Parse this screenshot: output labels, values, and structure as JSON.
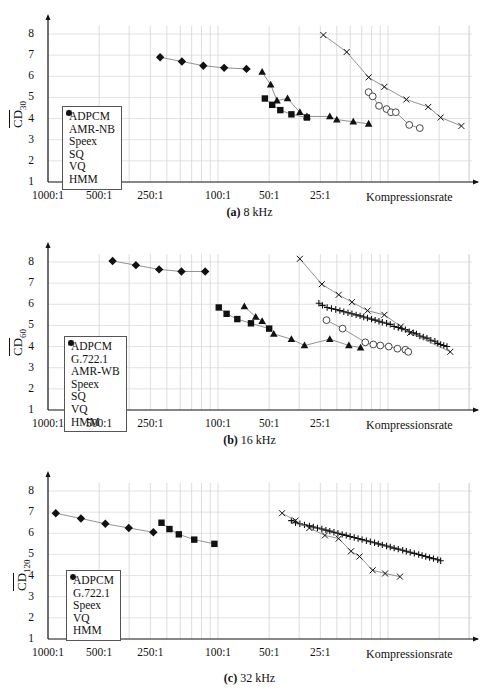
{
  "figure": {
    "x_axis_label": "Kompressionsrate",
    "x_ticks": [
      "1000:1",
      "500:1",
      "250:1",
      "100:1",
      "50:1",
      "25:1"
    ],
    "y_ticks": [
      "1",
      "2",
      "3",
      "4",
      "5",
      "6",
      "7",
      "8"
    ]
  },
  "panels": [
    {
      "caption_tag": "(a)",
      "caption_text": "8 kHz",
      "ylabel_main": "CD",
      "ylabel_sub": "30",
      "legend": [
        "ADPCM",
        "AMR-NB",
        "Speex",
        "SQ",
        "VQ",
        "HMM"
      ]
    },
    {
      "caption_tag": "(b)",
      "caption_text": "16 kHz",
      "ylabel_main": "CD",
      "ylabel_sub": "60",
      "legend": [
        "ADPCM",
        "G.722.1",
        "AMR-WB",
        "Speex",
        "SQ",
        "VQ",
        "HMM"
      ]
    },
    {
      "caption_tag": "(c)",
      "caption_text": "32 kHz",
      "ylabel_main": "CD",
      "ylabel_sub": "120",
      "legend": [
        "ADPCM",
        "G.722.1",
        "Speex",
        "VQ",
        "HMM"
      ]
    }
  ],
  "chart_data": [
    {
      "type": "line",
      "title": "(a) 8 kHz",
      "xlabel": "Kompressionsrate",
      "ylabel": "CD_30 (mean cepstral distance)",
      "xscale": "log (compression ratio, decreasing to the right)",
      "xlim": [
        "1000:1",
        "~2.5:1"
      ],
      "ylim": [
        1,
        8.5
      ],
      "grid": true,
      "legend_position": "lower left",
      "series": [
        {
          "name": "ADPCM",
          "marker": "dot",
          "points": [
            [
              1.9,
              5.55
            ]
          ]
        },
        {
          "name": "AMR-NB",
          "marker": "circle",
          "points": [
            [
              13.0,
              5.25
            ],
            [
              12.3,
              5.05
            ],
            [
              11.3,
              4.6
            ],
            [
              10.2,
              4.45
            ],
            [
              9.6,
              4.3
            ],
            [
              9.0,
              4.3
            ],
            [
              7.5,
              3.7
            ],
            [
              6.5,
              3.55
            ]
          ]
        },
        {
          "name": "Speex",
          "marker": "x",
          "points": [
            [
              24.0,
              7.95
            ],
            [
              17.5,
              7.15
            ],
            [
              13.0,
              5.95
            ],
            [
              10.5,
              5.5
            ],
            [
              7.8,
              4.9
            ],
            [
              5.8,
              4.55
            ],
            [
              4.9,
              4.05
            ],
            [
              3.7,
              3.65
            ]
          ]
        },
        {
          "name": "SQ",
          "marker": "triangle",
          "points": [
            [
              55,
              6.2
            ],
            [
              49,
              5.6
            ],
            [
              45,
              4.85
            ],
            [
              39,
              4.95
            ],
            [
              33,
              4.3
            ],
            [
              30,
              4.1
            ],
            [
              22,
              4.1
            ],
            [
              20,
              3.95
            ],
            [
              16,
              3.85
            ],
            [
              13,
              3.75
            ]
          ]
        },
        {
          "name": "VQ",
          "marker": "square",
          "points": [
            [
              53,
              4.95
            ],
            [
              48,
              4.65
            ],
            [
              43,
              4.4
            ],
            [
              37,
              4.2
            ],
            [
              30,
              4.05
            ]
          ]
        },
        {
          "name": "HMM",
          "marker": "diamond",
          "points": [
            [
              219,
              6.9
            ],
            [
              163,
              6.7
            ],
            [
              122,
              6.5
            ],
            [
              92,
              6.4
            ],
            [
              68,
              6.35
            ]
          ]
        }
      ]
    },
    {
      "type": "line",
      "title": "(b) 16 kHz",
      "xlabel": "Kompressionsrate",
      "ylabel": "CD_60 (mean cepstral distance)",
      "xscale": "log (compression ratio, decreasing to the right)",
      "xlim": [
        "1000:1",
        "~2.5:1"
      ],
      "ylim": [
        1,
        8.5
      ],
      "grid": true,
      "legend_position": "lower left",
      "series": [
        {
          "name": "ADPCM",
          "marker": "dot",
          "points": [
            [
              1.9,
              7.55
            ]
          ]
        },
        {
          "name": "G.722.1",
          "marker": "plus",
          "points": [
            [
              25.5,
              6.05
            ],
            [
              24.3,
              5.95
            ],
            [
              22.8,
              5.85
            ],
            [
              21.5,
              5.8
            ],
            [
              20.3,
              5.75
            ],
            [
              19.2,
              5.7
            ],
            [
              18.2,
              5.65
            ],
            [
              17.2,
              5.6
            ],
            [
              16.3,
              5.55
            ],
            [
              15.4,
              5.5
            ],
            [
              14.6,
              5.45
            ],
            [
              13.9,
              5.4
            ],
            [
              13.2,
              5.35
            ],
            [
              12.5,
              5.3
            ],
            [
              11.9,
              5.25
            ],
            [
              11.3,
              5.2
            ],
            [
              10.8,
              5.15
            ],
            [
              10.2,
              5.1
            ],
            [
              9.7,
              5.05
            ],
            [
              9.2,
              4.95
            ],
            [
              8.7,
              4.9
            ],
            [
              8.3,
              4.85
            ],
            [
              7.9,
              4.8
            ],
            [
              7.5,
              4.7
            ],
            [
              7.1,
              4.65
            ],
            [
              6.8,
              4.6
            ],
            [
              6.5,
              4.5
            ],
            [
              6.2,
              4.45
            ],
            [
              5.9,
              4.4
            ],
            [
              5.6,
              4.3
            ],
            [
              5.3,
              4.25
            ],
            [
              5.1,
              4.15
            ],
            [
              4.9,
              4.1
            ],
            [
              4.7,
              4.05
            ],
            [
              4.5,
              4.0
            ]
          ]
        },
        {
          "name": "AMR-WB",
          "marker": "circle",
          "points": [
            [
              23.0,
              5.25
            ],
            [
              18.5,
              4.85
            ],
            [
              13.6,
              4.2
            ],
            [
              12.2,
              4.1
            ],
            [
              11.1,
              4.05
            ],
            [
              9.9,
              4.0
            ],
            [
              8.8,
              3.9
            ],
            [
              7.9,
              3.85
            ],
            [
              7.6,
              3.75
            ]
          ]
        },
        {
          "name": "Speex",
          "marker": "x",
          "points": [
            [
              33,
              8.15
            ],
            [
              24.5,
              6.95
            ],
            [
              19.5,
              6.45
            ],
            [
              16.3,
              6.1
            ],
            [
              13.2,
              5.7
            ],
            [
              10.5,
              5.5
            ],
            [
              8.4,
              4.95
            ],
            [
              7.4,
              4.65
            ],
            [
              4.3,
              3.75
            ]
          ]
        },
        {
          "name": "SQ",
          "marker": "triangle",
          "points": [
            [
              70,
              5.9
            ],
            [
              60,
              5.4
            ],
            [
              55,
              5.2
            ],
            [
              47,
              4.6
            ],
            [
              37,
              4.35
            ],
            [
              31,
              4.05
            ],
            [
              22,
              4.35
            ],
            [
              17,
              4.05
            ],
            [
              14.5,
              3.95
            ]
          ]
        },
        {
          "name": "VQ",
          "marker": "square",
          "points": [
            [
              99,
              5.85
            ],
            [
              89,
              5.55
            ],
            [
              77,
              5.3
            ],
            [
              64,
              5.1
            ],
            [
              50,
              4.85
            ]
          ]
        },
        {
          "name": "HMM",
          "marker": "diamond",
          "points": [
            [
              417,
              8.05
            ],
            [
              304,
              7.85
            ],
            [
              222,
              7.65
            ],
            [
              164,
              7.55
            ],
            [
              119,
              7.55
            ]
          ]
        }
      ]
    },
    {
      "type": "line",
      "title": "(c) 32 kHz",
      "xlabel": "Kompressionsrate",
      "ylabel": "CD_120 (mean cepstral distance)",
      "xscale": "log (compression ratio, decreasing to the right)",
      "xlim": [
        "1000:1",
        "~2.5:1"
      ],
      "ylim": [
        1,
        8.5
      ],
      "grid": true,
      "legend_position": "lower left",
      "series": [
        {
          "name": "ADPCM",
          "marker": "dot",
          "points": [
            [
              1.9,
              4.4
            ]
          ]
        },
        {
          "name": "G.722.1",
          "marker": "plus",
          "points": [
            [
              37,
              6.6
            ],
            [
              35,
              6.5
            ],
            [
              33,
              6.45
            ],
            [
              31,
              6.4
            ],
            [
              29,
              6.35
            ],
            [
              27.5,
              6.3
            ],
            [
              26,
              6.25
            ],
            [
              24.5,
              6.2
            ],
            [
              23.2,
              6.15
            ],
            [
              22,
              6.1
            ],
            [
              20.8,
              6.05
            ],
            [
              19.7,
              6.0
            ],
            [
              18.6,
              5.95
            ],
            [
              17.6,
              5.9
            ],
            [
              16.7,
              5.85
            ],
            [
              15.8,
              5.8
            ],
            [
              15.0,
              5.75
            ],
            [
              14.2,
              5.7
            ],
            [
              13.4,
              5.65
            ],
            [
              12.7,
              5.6
            ],
            [
              12.0,
              5.55
            ],
            [
              11.4,
              5.5
            ],
            [
              10.8,
              5.45
            ],
            [
              10.2,
              5.4
            ],
            [
              9.7,
              5.35
            ],
            [
              9.2,
              5.3
            ],
            [
              8.7,
              5.25
            ],
            [
              8.2,
              5.2
            ],
            [
              7.8,
              5.15
            ],
            [
              7.4,
              5.1
            ],
            [
              7.0,
              5.05
            ],
            [
              6.6,
              5.0
            ],
            [
              6.3,
              4.95
            ],
            [
              6.0,
              4.9
            ],
            [
              5.7,
              4.85
            ],
            [
              5.4,
              4.8
            ],
            [
              5.1,
              4.75
            ],
            [
              4.9,
              4.7
            ]
          ]
        },
        {
          "name": "Speex",
          "marker": "x",
          "points": [
            [
              42,
              6.95
            ],
            [
              35,
              6.6
            ],
            [
              29,
              6.25
            ],
            [
              23.5,
              5.9
            ],
            [
              19.5,
              5.75
            ],
            [
              16.5,
              5.15
            ],
            [
              14.7,
              4.9
            ],
            [
              12.3,
              4.25
            ],
            [
              10.4,
              4.1
            ],
            [
              8.5,
              3.95
            ]
          ]
        },
        {
          "name": "VQ",
          "marker": "square",
          "points": [
            [
              215,
              6.5
            ],
            [
              193,
              6.2
            ],
            [
              170,
              5.95
            ],
            [
              138,
              5.7
            ],
            [
              105,
              5.5
            ]
          ]
        },
        {
          "name": "HMM",
          "marker": "diamond",
          "points": [
            [
              900,
              6.95
            ],
            [
              640,
              6.7
            ],
            [
              460,
              6.45
            ],
            [
              335,
              6.25
            ],
            [
              240,
              6.05
            ]
          ]
        }
      ]
    }
  ]
}
